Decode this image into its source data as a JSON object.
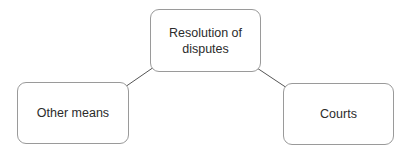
{
  "diagram": {
    "nodes": [
      {
        "id": "root",
        "label_line1": "Resolution of",
        "label_line2": "disputes"
      },
      {
        "id": "left",
        "label": "Other means"
      },
      {
        "id": "right",
        "label": "Courts"
      }
    ],
    "edges": [
      {
        "from": "root",
        "to": "left"
      },
      {
        "from": "root",
        "to": "right"
      }
    ],
    "colors": {
      "border": "#9a9a9a",
      "edge": "#555555",
      "text": "#2b2b2b"
    }
  }
}
